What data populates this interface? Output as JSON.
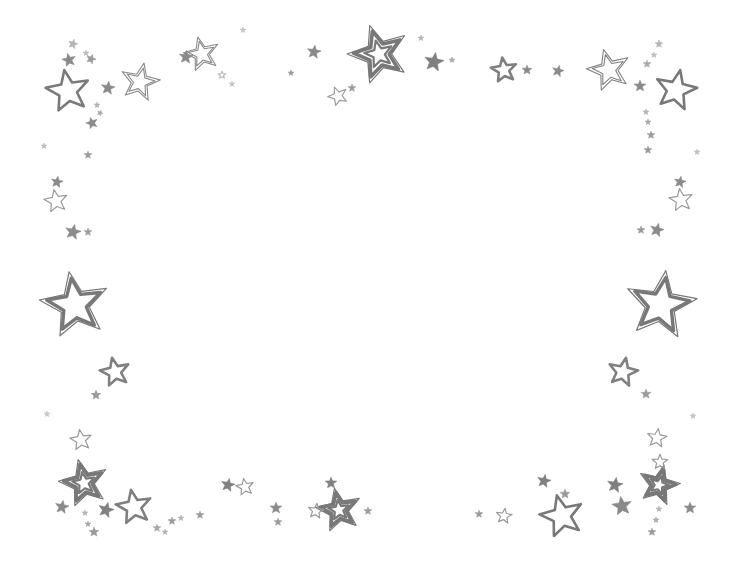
{
  "document": {
    "title": "Stars Border Frame",
    "description": "Decorative hand-drawn star border on a blank white page",
    "background_color": "#ffffff",
    "width": 739,
    "height": 571
  },
  "palette": {
    "ink_dark": "#6f6f6f",
    "ink_mid": "#808080",
    "ink_light": "#9a9a9a",
    "ink_faint": "#b4b4b4",
    "fill_none": "none",
    "paper": "#ffffff"
  },
  "center_area": {
    "label": "blank content area",
    "empty": true
  },
  "stars": [
    {
      "id": "s001",
      "x": 73,
      "y": 44,
      "r": 5,
      "rot": 15,
      "style": "filled",
      "color": "#b4b4b4"
    },
    {
      "id": "s002",
      "x": 86,
      "y": 53,
      "r": 3,
      "rot": 0,
      "style": "filled",
      "color": "#bdbdbd"
    },
    {
      "id": "s003",
      "x": 69,
      "y": 60,
      "r": 7,
      "rot": -12,
      "style": "filled",
      "color": "#8a8a8a"
    },
    {
      "id": "s004",
      "x": 91,
      "y": 59,
      "r": 5,
      "rot": 20,
      "style": "filled",
      "color": "#9a9a9a"
    },
    {
      "id": "s005",
      "x": 68,
      "y": 91,
      "r": 22,
      "rot": -10,
      "style": "outline-thick",
      "color": "#7a7a7a"
    },
    {
      "id": "s006",
      "x": 108,
      "y": 88,
      "r": 7,
      "rot": 8,
      "style": "filled",
      "color": "#8a8a8a"
    },
    {
      "id": "s007",
      "x": 97,
      "y": 105,
      "r": 3,
      "rot": 0,
      "style": "filled",
      "color": "#b4b4b4"
    },
    {
      "id": "s008",
      "x": 100,
      "y": 113,
      "r": 3,
      "rot": 25,
      "style": "filled",
      "color": "#a8a8a8"
    },
    {
      "id": "s009",
      "x": 92,
      "y": 123,
      "r": 6,
      "rot": -18,
      "style": "filled",
      "color": "#8a8a8a"
    },
    {
      "id": "s010",
      "x": 140,
      "y": 82,
      "r": 20,
      "rot": 12,
      "style": "double-thin",
      "color": "#8a8a8a"
    },
    {
      "id": "s011",
      "x": 202,
      "y": 54,
      "r": 18,
      "rot": -14,
      "style": "double-thin",
      "color": "#8a8a8a"
    },
    {
      "id": "s012",
      "x": 186,
      "y": 57,
      "r": 7,
      "rot": 6,
      "style": "filled",
      "color": "#8a8a8a"
    },
    {
      "id": "s013",
      "x": 222,
      "y": 75,
      "r": 4,
      "rot": 0,
      "style": "outline-thin",
      "color": "#bdbdbd"
    },
    {
      "id": "s014",
      "x": 232,
      "y": 84,
      "r": 3,
      "rot": 0,
      "style": "filled",
      "color": "#c4c4c4"
    },
    {
      "id": "s015",
      "x": 291,
      "y": 73,
      "r": 3,
      "rot": 0,
      "style": "filled",
      "color": "#9a9a9a"
    },
    {
      "id": "s016",
      "x": 314,
      "y": 52,
      "r": 7,
      "rot": 9,
      "style": "filled",
      "color": "#8a8a8a"
    },
    {
      "id": "s017",
      "x": 338,
      "y": 96,
      "r": 10,
      "rot": -22,
      "style": "outline-thin",
      "color": "#9a9a9a"
    },
    {
      "id": "s018",
      "x": 352,
      "y": 88,
      "r": 4,
      "rot": 0,
      "style": "filled",
      "color": "#9a9a9a"
    },
    {
      "id": "s019",
      "x": 379,
      "y": 54,
      "r": 31,
      "rot": -18,
      "style": "triple",
      "color": "#787878"
    },
    {
      "id": "s020",
      "x": 434,
      "y": 62,
      "r": 10,
      "rot": 10,
      "style": "filled",
      "color": "#808080"
    },
    {
      "id": "s021",
      "x": 452,
      "y": 60,
      "r": 3,
      "rot": 0,
      "style": "filled",
      "color": "#a8a8a8"
    },
    {
      "id": "s022",
      "x": 504,
      "y": 70,
      "r": 13,
      "rot": -8,
      "style": "outline-thick",
      "color": "#808080"
    },
    {
      "id": "s023",
      "x": 527,
      "y": 70,
      "r": 5,
      "rot": 0,
      "style": "filled",
      "color": "#8a8a8a"
    },
    {
      "id": "s024",
      "x": 558,
      "y": 71,
      "r": 6,
      "rot": 14,
      "style": "filled",
      "color": "#8a8a8a"
    },
    {
      "id": "s025",
      "x": 609,
      "y": 70,
      "r": 22,
      "rot": -15,
      "style": "double-thin",
      "color": "#808080"
    },
    {
      "id": "s026",
      "x": 640,
      "y": 86,
      "r": 6,
      "rot": 0,
      "style": "filled",
      "color": "#8a8a8a"
    },
    {
      "id": "s027",
      "x": 659,
      "y": 44,
      "r": 4,
      "rot": 0,
      "style": "filled",
      "color": "#b4b4b4"
    },
    {
      "id": "s028",
      "x": 654,
      "y": 55,
      "r": 3,
      "rot": 0,
      "style": "filled",
      "color": "#bdbdbd"
    },
    {
      "id": "s029",
      "x": 647,
      "y": 64,
      "r": 4,
      "rot": 0,
      "style": "filled",
      "color": "#a8a8a8"
    },
    {
      "id": "s030",
      "x": 676,
      "y": 90,
      "r": 21,
      "rot": 12,
      "style": "outline-thick",
      "color": "#787878"
    },
    {
      "id": "s031",
      "x": 646,
      "y": 112,
      "r": 3,
      "rot": 0,
      "style": "filled",
      "color": "#b4b4b4"
    },
    {
      "id": "s032",
      "x": 648,
      "y": 122,
      "r": 3,
      "rot": 0,
      "style": "filled",
      "color": "#a8a8a8"
    },
    {
      "id": "s033",
      "x": 651,
      "y": 135,
      "r": 4,
      "rot": 0,
      "style": "filled",
      "color": "#9a9a9a"
    },
    {
      "id": "s034",
      "x": 648,
      "y": 150,
      "r": 4,
      "rot": 0,
      "style": "filled",
      "color": "#9a9a9a"
    },
    {
      "id": "s035",
      "x": 88,
      "y": 155,
      "r": 4,
      "rot": 0,
      "style": "filled",
      "color": "#9a9a9a"
    },
    {
      "id": "s036",
      "x": 57,
      "y": 182,
      "r": 6,
      "rot": 10,
      "style": "filled",
      "color": "#8a8a8a"
    },
    {
      "id": "s037",
      "x": 56,
      "y": 201,
      "r": 12,
      "rot": -10,
      "style": "outline-thin",
      "color": "#9a9a9a"
    },
    {
      "id": "s038",
      "x": 73,
      "y": 232,
      "r": 8,
      "rot": 12,
      "style": "filled",
      "color": "#8a8a8a"
    },
    {
      "id": "s039",
      "x": 88,
      "y": 232,
      "r": 4,
      "rot": 0,
      "style": "filled",
      "color": "#9a9a9a"
    },
    {
      "id": "s040",
      "x": 680,
      "y": 182,
      "r": 6,
      "rot": 10,
      "style": "filled",
      "color": "#8a8a8a"
    },
    {
      "id": "s041",
      "x": 681,
      "y": 200,
      "r": 12,
      "rot": -8,
      "style": "outline-thin",
      "color": "#9a9a9a"
    },
    {
      "id": "s042",
      "x": 657,
      "y": 230,
      "r": 7,
      "rot": 14,
      "style": "filled",
      "color": "#8a8a8a"
    },
    {
      "id": "s043",
      "x": 641,
      "y": 230,
      "r": 4,
      "rot": 0,
      "style": "filled",
      "color": "#9a9a9a"
    },
    {
      "id": "s044",
      "x": 75,
      "y": 305,
      "r": 35,
      "rot": -10,
      "style": "double-thick",
      "color": "#787878"
    },
    {
      "id": "s045",
      "x": 661,
      "y": 305,
      "r": 36,
      "rot": 8,
      "style": "double-thick",
      "color": "#787878"
    },
    {
      "id": "s046",
      "x": 115,
      "y": 372,
      "r": 15,
      "rot": -12,
      "style": "outline-thick",
      "color": "#808080"
    },
    {
      "id": "s047",
      "x": 96,
      "y": 395,
      "r": 5,
      "rot": 0,
      "style": "filled",
      "color": "#9a9a9a"
    },
    {
      "id": "s048",
      "x": 623,
      "y": 372,
      "r": 15,
      "rot": 12,
      "style": "outline-thick",
      "color": "#808080"
    },
    {
      "id": "s049",
      "x": 646,
      "y": 394,
      "r": 5,
      "rot": 0,
      "style": "filled",
      "color": "#9a9a9a"
    },
    {
      "id": "s050",
      "x": 81,
      "y": 440,
      "r": 11,
      "rot": -8,
      "style": "outline-thin",
      "color": "#9a9a9a"
    },
    {
      "id": "s051",
      "x": 657,
      "y": 438,
      "r": 10,
      "rot": 8,
      "style": "outline-thin",
      "color": "#9a9a9a"
    },
    {
      "id": "s052",
      "x": 84,
      "y": 483,
      "r": 25,
      "rot": -14,
      "style": "triple",
      "color": "#787878"
    },
    {
      "id": "s053",
      "x": 62,
      "y": 507,
      "r": 7,
      "rot": 10,
      "style": "filled",
      "color": "#8a8a8a"
    },
    {
      "id": "s054",
      "x": 85,
      "y": 513,
      "r": 3,
      "rot": 0,
      "style": "filled",
      "color": "#b4b4b4"
    },
    {
      "id": "s055",
      "x": 88,
      "y": 524,
      "r": 3,
      "rot": 0,
      "style": "filled",
      "color": "#a8a8a8"
    },
    {
      "id": "s056",
      "x": 94,
      "y": 532,
      "r": 5,
      "rot": 0,
      "style": "filled",
      "color": "#9a9a9a"
    },
    {
      "id": "s057",
      "x": 106,
      "y": 510,
      "r": 8,
      "rot": 15,
      "style": "filled",
      "color": "#808080"
    },
    {
      "id": "s058",
      "x": 134,
      "y": 507,
      "r": 18,
      "rot": -10,
      "style": "outline-thick",
      "color": "#808080"
    },
    {
      "id": "s059",
      "x": 157,
      "y": 528,
      "r": 4,
      "rot": 0,
      "style": "filled",
      "color": "#a8a8a8"
    },
    {
      "id": "s060",
      "x": 165,
      "y": 532,
      "r": 3,
      "rot": 0,
      "style": "filled",
      "color": "#b4b4b4"
    },
    {
      "id": "s061",
      "x": 172,
      "y": 521,
      "r": 4,
      "rot": 0,
      "style": "filled",
      "color": "#9a9a9a"
    },
    {
      "id": "s062",
      "x": 181,
      "y": 518,
      "r": 3,
      "rot": 0,
      "style": "filled",
      "color": "#b4b4b4"
    },
    {
      "id": "s063",
      "x": 200,
      "y": 515,
      "r": 4,
      "rot": 0,
      "style": "filled",
      "color": "#9a9a9a"
    },
    {
      "id": "s064",
      "x": 228,
      "y": 485,
      "r": 7,
      "rot": 12,
      "style": "filled",
      "color": "#808080"
    },
    {
      "id": "s065",
      "x": 245,
      "y": 487,
      "r": 9,
      "rot": -10,
      "style": "outline-thin",
      "color": "#9a9a9a"
    },
    {
      "id": "s066",
      "x": 276,
      "y": 508,
      "r": 6,
      "rot": 0,
      "style": "filled",
      "color": "#8a8a8a"
    },
    {
      "id": "s067",
      "x": 278,
      "y": 522,
      "r": 4,
      "rot": 0,
      "style": "filled",
      "color": "#9a9a9a"
    },
    {
      "id": "s068",
      "x": 331,
      "y": 483,
      "r": 6,
      "rot": 0,
      "style": "filled",
      "color": "#808080"
    },
    {
      "id": "s069",
      "x": 339,
      "y": 510,
      "r": 23,
      "rot": -12,
      "style": "triple",
      "color": "#787878"
    },
    {
      "id": "s070",
      "x": 316,
      "y": 511,
      "r": 8,
      "rot": 8,
      "style": "outline-thin",
      "color": "#9a9a9a"
    },
    {
      "id": "s071",
      "x": 368,
      "y": 511,
      "r": 4,
      "rot": 0,
      "style": "filled",
      "color": "#9a9a9a"
    },
    {
      "id": "s072",
      "x": 479,
      "y": 514,
      "r": 4,
      "rot": 0,
      "style": "filled",
      "color": "#9a9a9a"
    },
    {
      "id": "s073",
      "x": 504,
      "y": 516,
      "r": 8,
      "rot": 8,
      "style": "outline-thin",
      "color": "#9a9a9a"
    },
    {
      "id": "s074",
      "x": 544,
      "y": 481,
      "r": 7,
      "rot": 12,
      "style": "filled",
      "color": "#808080"
    },
    {
      "id": "s075",
      "x": 565,
      "y": 494,
      "r": 5,
      "rot": 0,
      "style": "filled",
      "color": "#9a9a9a"
    },
    {
      "id": "s076",
      "x": 562,
      "y": 516,
      "r": 22,
      "rot": -14,
      "style": "outline-thick",
      "color": "#787878"
    },
    {
      "id": "s077",
      "x": 615,
      "y": 485,
      "r": 8,
      "rot": 10,
      "style": "filled",
      "color": "#808080"
    },
    {
      "id": "s078",
      "x": 622,
      "y": 506,
      "r": 10,
      "rot": -8,
      "style": "filled",
      "color": "#8a8a8a"
    },
    {
      "id": "s079",
      "x": 659,
      "y": 485,
      "r": 21,
      "rot": 14,
      "style": "triple",
      "color": "#787878"
    },
    {
      "id": "s080",
      "x": 659,
      "y": 509,
      "r": 3,
      "rot": 0,
      "style": "filled",
      "color": "#b4b4b4"
    },
    {
      "id": "s081",
      "x": 656,
      "y": 520,
      "r": 3,
      "rot": 0,
      "style": "filled",
      "color": "#a8a8a8"
    },
    {
      "id": "s082",
      "x": 652,
      "y": 532,
      "r": 4,
      "rot": 0,
      "style": "filled",
      "color": "#9a9a9a"
    },
    {
      "id": "s083",
      "x": 690,
      "y": 508,
      "r": 6,
      "rot": 0,
      "style": "filled",
      "color": "#8a8a8a"
    },
    {
      "id": "s084",
      "x": 660,
      "y": 462,
      "r": 8,
      "rot": 0,
      "style": "outline-thin",
      "color": "#9a9a9a"
    },
    {
      "id": "s085",
      "x": 421,
      "y": 38,
      "r": 3,
      "rot": 0,
      "style": "filled",
      "color": "#b4b4b4"
    },
    {
      "id": "s086",
      "x": 243,
      "y": 30,
      "r": 3,
      "rot": 0,
      "style": "filled",
      "color": "#c4c4c4"
    },
    {
      "id": "s087",
      "x": 697,
      "y": 152,
      "r": 3,
      "rot": 0,
      "style": "filled",
      "color": "#bdbdbd"
    },
    {
      "id": "s088",
      "x": 44,
      "y": 146,
      "r": 3,
      "rot": 0,
      "style": "filled",
      "color": "#bdbdbd"
    },
    {
      "id": "s089",
      "x": 47,
      "y": 414,
      "r": 3,
      "rot": 0,
      "style": "filled",
      "color": "#c4c4c4"
    },
    {
      "id": "s090",
      "x": 693,
      "y": 416,
      "r": 3,
      "rot": 0,
      "style": "filled",
      "color": "#c4c4c4"
    }
  ]
}
